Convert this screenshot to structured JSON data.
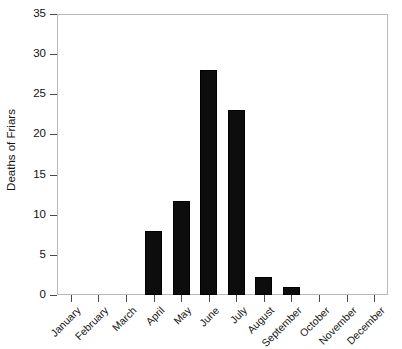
{
  "chart_data": {
    "type": "bar",
    "title": "",
    "xlabel": "",
    "ylabel": "Deaths of Friars",
    "categories": [
      "January",
      "February",
      "March",
      "April",
      "May",
      "June",
      "July",
      "August",
      "September",
      "October",
      "November",
      "December"
    ],
    "values": [
      0,
      0,
      0,
      8,
      11.7,
      28,
      23,
      2.3,
      1,
      0,
      0,
      0
    ],
    "ylim": [
      0,
      35
    ],
    "yticks": [
      0,
      5,
      10,
      15,
      20,
      25,
      30,
      35
    ],
    "ytick_labels": [
      "0",
      "5",
      "10",
      "15",
      "20",
      "25",
      "30",
      "35"
    ],
    "grid": false,
    "legend": null,
    "bar_color": "#0d0d0d",
    "frame_color": "#b9b9b9",
    "background": "#ffffff"
  }
}
